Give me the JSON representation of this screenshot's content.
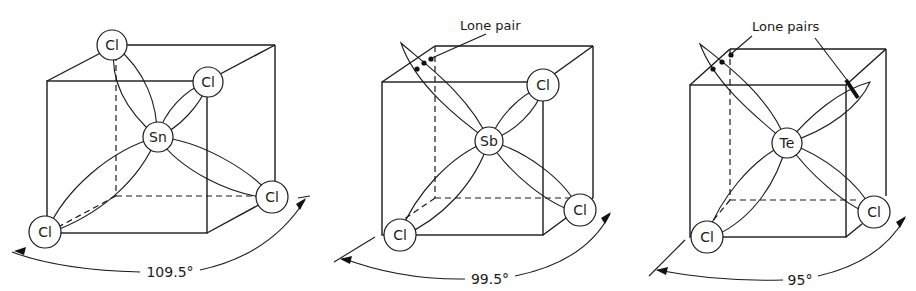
{
  "figure": {
    "panels": [
      {
        "id": "sncl4",
        "central_atom": "Sn",
        "ligands": [
          "Cl",
          "Cl",
          "Cl",
          "Cl"
        ],
        "lone_pair_label": "",
        "bond_angle": "109.5°"
      },
      {
        "id": "sbcl3",
        "central_atom": "Sb",
        "ligands": [
          "Cl",
          "Cl",
          "Cl"
        ],
        "lone_pair_label": "Lone pair",
        "bond_angle": "99.5°"
      },
      {
        "id": "tecl2",
        "central_atom": "Te",
        "ligands": [
          "Cl",
          "Cl"
        ],
        "lone_pair_label": "Lone pairs",
        "bond_angle": "95°"
      }
    ]
  }
}
